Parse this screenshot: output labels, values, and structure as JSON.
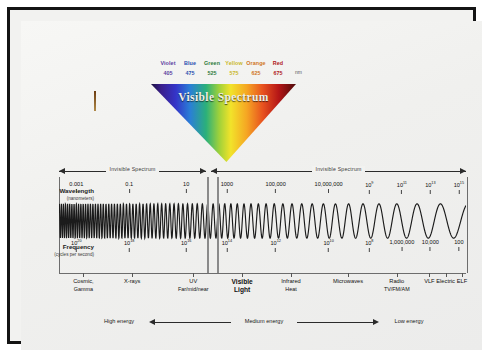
{
  "cone": {
    "label": "Visible Spectrum",
    "unit": "nm",
    "colors": [
      {
        "name": "Violet",
        "value": "405"
      },
      {
        "name": "Blue",
        "value": "475"
      },
      {
        "name": "Green",
        "value": "525"
      },
      {
        "name": "Yellow",
        "value": "575"
      },
      {
        "name": "Orange",
        "value": "625"
      },
      {
        "name": "Red",
        "value": "675"
      }
    ]
  },
  "invisible": {
    "left_label": "Invisible Spectrum",
    "right_label": "Invisible Spectrum"
  },
  "wavelength": {
    "title": "Wavelength",
    "subtitle": "(nanometers)",
    "ticks": [
      {
        "text": "0.001",
        "exp": "",
        "pos": 4
      },
      {
        "text": "0.1",
        "exp": "",
        "pos": 17
      },
      {
        "text": "10",
        "exp": "",
        "pos": 31
      },
      {
        "text": "1000",
        "exp": "",
        "pos": 41
      },
      {
        "text": "100,000",
        "exp": "",
        "pos": 53
      },
      {
        "text": "10,000,000",
        "exp": "",
        "pos": 66
      },
      {
        "text": "10",
        "exp": "9",
        "pos": 76
      },
      {
        "text": "10",
        "exp": "11",
        "pos": 84
      },
      {
        "text": "10",
        "exp": "13",
        "pos": 91
      },
      {
        "text": "10",
        "exp": "15",
        "pos": 98
      }
    ]
  },
  "frequency": {
    "title": "Frequency",
    "subtitle": "(cycles per second)",
    "ticks": [
      {
        "text": "10",
        "exp": "20",
        "pos": 4
      },
      {
        "text": "10",
        "exp": "18",
        "pos": 17
      },
      {
        "text": "10",
        "exp": "16",
        "pos": 31
      },
      {
        "text": "10",
        "exp": "14",
        "pos": 41
      },
      {
        "text": "10",
        "exp": "12",
        "pos": 53
      },
      {
        "text": "10",
        "exp": "10",
        "pos": 66
      },
      {
        "text": "10",
        "exp": "8",
        "pos": 76
      },
      {
        "text": "1,000,000",
        "exp": "",
        "pos": 84
      },
      {
        "text": "10,000",
        "exp": "",
        "pos": 91
      },
      {
        "text": "100",
        "exp": "",
        "pos": 98
      }
    ]
  },
  "categories": [
    {
      "lines": [
        "Cosmic,",
        "Gamma"
      ],
      "pos": 6,
      "highlight": false
    },
    {
      "lines": [
        "X-rays"
      ],
      "pos": 18,
      "highlight": false
    },
    {
      "lines": [
        "UV",
        "Far/mid/near"
      ],
      "pos": 33,
      "highlight": false
    },
    {
      "lines": [
        "Visible",
        "Light"
      ],
      "pos": 45,
      "highlight": true
    },
    {
      "lines": [
        "Infrared",
        "Heat"
      ],
      "pos": 57,
      "highlight": false
    },
    {
      "lines": [
        "Microwaves"
      ],
      "pos": 71,
      "highlight": false
    },
    {
      "lines": [
        "Radio",
        "TV/FM/AM"
      ],
      "pos": 83,
      "highlight": false
    },
    {
      "lines": [
        "VLF"
      ],
      "pos": 91,
      "highlight": false
    },
    {
      "lines": [
        "Electric"
      ],
      "pos": 95,
      "highlight": false
    },
    {
      "lines": [
        "ELF"
      ],
      "pos": 99,
      "highlight": false
    }
  ],
  "energy": {
    "high": "High energy",
    "medium": "Medium energy",
    "low": "Low energy"
  },
  "chart_data": {
    "type": "line",
    "xlabel": "Wavelength (nanometers) / Frequency (cycles per second)",
    "ylabel": "",
    "series": [
      {
        "name": "Wavelength (nanometers)",
        "values": [
          "0.001",
          "0.1",
          "10",
          "1000",
          "100,000",
          "10,000,000",
          "10^9",
          "10^11",
          "10^13",
          "10^15"
        ]
      },
      {
        "name": "Frequency (cycles per second)",
        "values": [
          "10^20",
          "10^18",
          "10^16",
          "10^14",
          "10^12",
          "10^10",
          "10^8",
          "1,000,000",
          "10,000",
          "100"
        ]
      }
    ],
    "bands": [
      "Cosmic, Gamma",
      "X-rays",
      "UV Far/mid/near",
      "Visible Light",
      "Infrared Heat",
      "Microwaves",
      "Radio TV/FM/AM",
      "VLF",
      "Electric",
      "ELF"
    ],
    "visible_colors_nm": {
      "Violet": 405,
      "Blue": 475,
      "Green": 525,
      "Yellow": 575,
      "Orange": 625,
      "Red": 675
    },
    "annotations": [
      "Invisible Spectrum",
      "Invisible Spectrum",
      "High energy",
      "Medium energy",
      "Low energy"
    ],
    "grid": false,
    "legend": "none"
  }
}
